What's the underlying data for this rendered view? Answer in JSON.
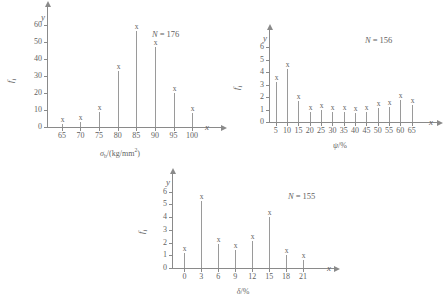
{
  "figure": {
    "background_color": "#ffffff",
    "line_color": "#8a8a8a",
    "text_color": "#5f5f5f",
    "point_glyph": "x"
  },
  "chart_data": [
    {
      "id": "chart-1",
      "type": "scatter",
      "title": "",
      "xlabel": "σb/(kg/mm2)",
      "xlabel_base": "σ",
      "xlabel_sub": "b",
      "xlabel_rest": "/(kg/mm",
      "xlabel_sup": "2",
      "xlabel_tail": ")",
      "ylabel": "fi",
      "ylabel_base": "f",
      "ylabel_sub": "i",
      "x_axis_name": "x",
      "y_axis_name": "y",
      "annotation": "N = 176",
      "annotation_n": "N",
      "annotation_eq": "= 176",
      "sample_size": 176,
      "x_ticks": [
        65,
        70,
        75,
        80,
        85,
        90,
        95,
        100
      ],
      "y_ticks": [
        0,
        10,
        20,
        30,
        40,
        50,
        60
      ],
      "xlim": [
        61,
        104
      ],
      "ylim": [
        0,
        65
      ],
      "grid": false,
      "legend": "none",
      "points": [
        {
          "x": 65,
          "y": 2
        },
        {
          "x": 70,
          "y": 3
        },
        {
          "x": 75,
          "y": 9
        },
        {
          "x": 80,
          "y": 33
        },
        {
          "x": 85,
          "y": 57
        },
        {
          "x": 90,
          "y": 47
        },
        {
          "x": 95,
          "y": 20
        },
        {
          "x": 100,
          "y": 8
        }
      ]
    },
    {
      "id": "chart-2",
      "type": "scatter",
      "title": "",
      "xlabel": "ψ/%",
      "xlabel_base": "ψ",
      "xlabel_rest": "/%",
      "ylabel": "fi",
      "ylabel_base": "f",
      "ylabel_sub": "i",
      "x_axis_name": "x",
      "y_axis_name": "y",
      "annotation": "N = 156",
      "annotation_n": "N",
      "annotation_eq": "= 156",
      "sample_size": 156,
      "x_ticks": [
        5,
        10,
        15,
        20,
        25,
        30,
        35,
        40,
        45,
        50,
        55,
        60,
        65
      ],
      "y_ticks": [
        0,
        1,
        2,
        3,
        4,
        5,
        6
      ],
      "xlim": [
        2,
        70
      ],
      "ylim": [
        0,
        6.6
      ],
      "grid": false,
      "legend": "none",
      "points": [
        {
          "x": 5,
          "y": 3.2
        },
        {
          "x": 10,
          "y": 4.3
        },
        {
          "x": 15,
          "y": 1.7
        },
        {
          "x": 20,
          "y": 0.8
        },
        {
          "x": 25,
          "y": 1.0
        },
        {
          "x": 30,
          "y": 0.8
        },
        {
          "x": 35,
          "y": 0.8
        },
        {
          "x": 40,
          "y": 0.7
        },
        {
          "x": 45,
          "y": 0.8
        },
        {
          "x": 50,
          "y": 1.1
        },
        {
          "x": 55,
          "y": 1.2
        },
        {
          "x": 60,
          "y": 1.8
        },
        {
          "x": 65,
          "y": 1.4
        }
      ]
    },
    {
      "id": "chart-3",
      "type": "scatter",
      "title": "",
      "xlabel": "δ/%",
      "xlabel_base": "δ",
      "xlabel_rest": "/%",
      "ylabel": "fi",
      "ylabel_base": "f",
      "ylabel_sub": "i",
      "x_axis_name": "x",
      "y_axis_name": "y",
      "annotation": "N = 155",
      "annotation_n": "N",
      "annotation_eq": "= 155",
      "sample_size": 155,
      "x_ticks": [
        0,
        3,
        6,
        9,
        12,
        15,
        18,
        21
      ],
      "y_ticks": [
        0,
        1,
        2,
        3,
        4,
        5,
        6
      ],
      "xlim": [
        -2.2,
        24
      ],
      "ylim": [
        0,
        6.6
      ],
      "grid": false,
      "legend": "none",
      "points": [
        {
          "x": 0,
          "y": 1.2
        },
        {
          "x": 3,
          "y": 5.3
        },
        {
          "x": 6,
          "y": 1.9
        },
        {
          "x": 9,
          "y": 1.4
        },
        {
          "x": 12,
          "y": 2.1
        },
        {
          "x": 15,
          "y": 4.0
        },
        {
          "x": 18,
          "y": 1.0
        },
        {
          "x": 21,
          "y": 0.6
        }
      ]
    }
  ]
}
